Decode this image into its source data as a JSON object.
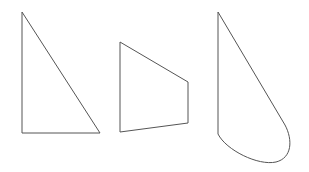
{
  "canvas": {
    "width": 309,
    "height": 172,
    "background": "#ffffff"
  },
  "style": {
    "stroke": "#555555"
  },
  "shapes": [
    {
      "name": "right-triangle",
      "points": "22,12 22,133 100,133"
    },
    {
      "name": "trapezoid",
      "points": "120,42 188,82 188,123 120,132"
    },
    {
      "name": "curved-triangle",
      "d": "M218,12 L285,125 C293,140 292,158 276,162 C258,166 226,150 218,134 Z"
    }
  ]
}
